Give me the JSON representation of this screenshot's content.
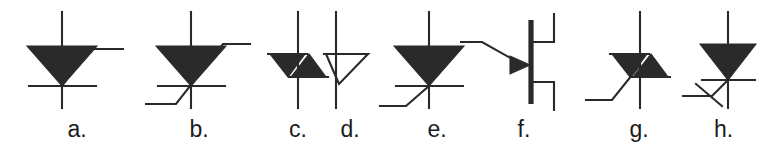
{
  "figure": {
    "background_color": "#ffffff",
    "ink_color": "#2a2a2a",
    "label_color": "#1c1c1c",
    "width": 769,
    "height": 149,
    "symbol_count": 8
  },
  "symbols": [
    {
      "id": "a",
      "label": "a.",
      "name": "scr-gate-upper-right",
      "description": "Silicon controlled rectifier: filled downward triangle over horizontal cathode bar, vertical anode-cathode lead, gate lead leaving triangle apex to the upper right",
      "left": 18,
      "width": 118,
      "filled": true,
      "gate": "upper-right"
    },
    {
      "id": "b",
      "label": "b.",
      "name": "scr-gate-through-lower-left",
      "description": "Silicon controlled rectifier with gate lead drawn as a long diagonal crossing the body from lower left to upper right",
      "left": 138,
      "width": 122,
      "filled": true,
      "gate": "diagonal-through"
    },
    {
      "id": "c",
      "label": "c.",
      "name": "diac-bidirectional-trigger-diode",
      "description": "DIAC: two opposed filled triangles between two horizontal bars on a vertical lead, no gate",
      "left": 252,
      "width": 92,
      "filled": true,
      "gate": "none"
    },
    {
      "id": "d",
      "label": "d.",
      "name": "open-triangle-device",
      "description": "Unfilled outline triangle with horizontal top bar, apex pointing down onto the vertical lead",
      "left": 314,
      "width": 72,
      "filled": false,
      "gate": "none"
    },
    {
      "id": "e",
      "label": "e.",
      "name": "scr-gate-lower-left",
      "description": "Silicon controlled rectifier with gate lead leaving the triangle apex down to the lower left",
      "left": 378,
      "width": 118,
      "filled": true,
      "gate": "lower-left"
    },
    {
      "id": "f",
      "label": "f.",
      "name": "igbt-mosfet-style-device",
      "description": "Thick vertical gate bar with arrowhead gate lead entering from the left and two right-hand channel stubs leading to separate top and bottom leads",
      "left": 460,
      "width": 128,
      "filled": true,
      "gate": "arrow-left"
    },
    {
      "id": "g",
      "label": "g.",
      "name": "triac-bidirectional-thyristor",
      "description": "TRIAC: DIAC body of two opposed filled triangles with a gate lead running down to the lower left",
      "left": 584,
      "width": 110,
      "filled": true,
      "gate": "lower-left"
    },
    {
      "id": "h",
      "label": "h.",
      "name": "scr-crossed-gate-lead",
      "description": "Silicon controlled rectifier with a gate lead to the lower left crossed by a short slash mark",
      "left": 678,
      "width": 91,
      "filled": true,
      "gate": "lower-left-crossed"
    }
  ]
}
